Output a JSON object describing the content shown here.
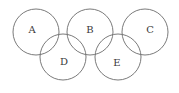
{
  "diagram": {
    "type": "five-interlocking-circles",
    "circles": [
      {
        "id": "A",
        "label": "A",
        "row": "top"
      },
      {
        "id": "B",
        "label": "B",
        "row": "top"
      },
      {
        "id": "C",
        "label": "C",
        "row": "top"
      },
      {
        "id": "D",
        "label": "D",
        "row": "bottom"
      },
      {
        "id": "E",
        "label": "E",
        "row": "bottom"
      }
    ],
    "overlaps": [
      [
        "A",
        "D"
      ],
      [
        "D",
        "B"
      ],
      [
        "B",
        "E"
      ],
      [
        "E",
        "C"
      ]
    ],
    "stroke_color": "#6b6b6b",
    "label_color": "#3a3a3a"
  }
}
